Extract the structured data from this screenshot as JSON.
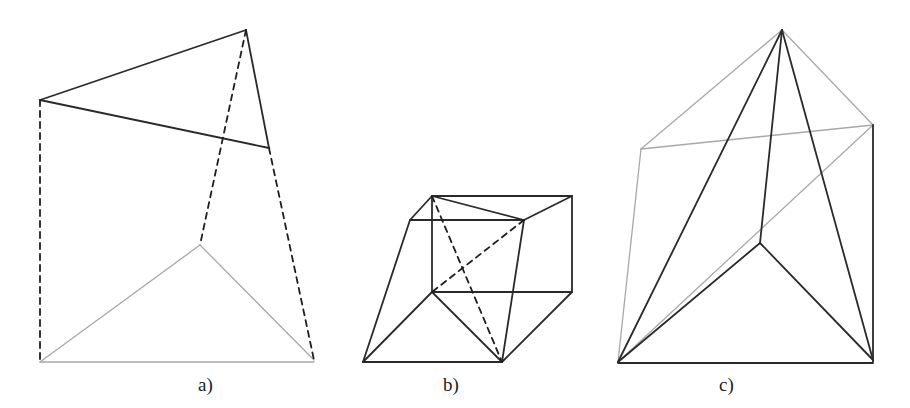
{
  "figure": {
    "panels": [
      {
        "label": "a)",
        "edges": {
          "dark": [
            [
              [
                40,
                100
              ],
              [
                246,
                30
              ]
            ],
            [
              [
                40,
                100
              ],
              [
                269,
                148
              ]
            ],
            [
              [
                246,
                30
              ],
              [
                269,
                148
              ]
            ]
          ],
          "dashed": [
            [
              [
                40,
                100
              ],
              [
                40,
                362
              ]
            ],
            [
              [
                246,
                30
              ],
              [
                200,
                245
              ]
            ],
            [
              [
                269,
                148
              ],
              [
                314,
                360
              ]
            ]
          ],
          "light": [
            [
              [
                40,
                362
              ],
              [
                200,
                245
              ]
            ],
            [
              [
                200,
                245
              ],
              [
                314,
                360
              ]
            ],
            [
              [
                40,
                362
              ],
              [
                314,
                362
              ]
            ]
          ]
        }
      },
      {
        "label": "b)",
        "edges": {
          "dark": [
            [
              [
                432,
                196
              ],
              [
                572,
                196
              ]
            ],
            [
              [
                432,
                196
              ],
              [
                410,
                220
              ]
            ],
            [
              [
                410,
                220
              ],
              [
                524,
                220
              ]
            ],
            [
              [
                432,
                196
              ],
              [
                524,
                220
              ]
            ],
            [
              [
                572,
                196
              ],
              [
                524,
                220
              ]
            ],
            [
              [
                572,
                196
              ],
              [
                572,
                292
              ]
            ],
            [
              [
                432,
                196
              ],
              [
                432,
                292
              ]
            ],
            [
              [
                432,
                292
              ],
              [
                572,
                292
              ]
            ],
            [
              [
                410,
                220
              ],
              [
                363,
                362
              ]
            ],
            [
              [
                363,
                362
              ],
              [
                502,
                362
              ]
            ],
            [
              [
                432,
                292
              ],
              [
                363,
                362
              ]
            ],
            [
              [
                432,
                292
              ],
              [
                502,
                362
              ]
            ],
            [
              [
                524,
                220
              ],
              [
                502,
                362
              ]
            ],
            [
              [
                572,
                292
              ],
              [
                502,
                362
              ]
            ]
          ],
          "dashed": [
            [
              [
                432,
                196
              ],
              [
                502,
                362
              ]
            ],
            [
              [
                524,
                220
              ],
              [
                432,
                292
              ]
            ]
          ],
          "light": []
        }
      },
      {
        "label": "c)",
        "edges": {
          "dark": [
            [
              [
                782,
                30
              ],
              [
                618,
                362
              ]
            ],
            [
              [
                782,
                30
              ],
              [
                760,
                243
              ]
            ],
            [
              [
                782,
                30
              ],
              [
                873,
                360
              ]
            ],
            [
              [
                760,
                243
              ],
              [
                618,
                362
              ]
            ],
            [
              [
                760,
                243
              ],
              [
                873,
                360
              ]
            ],
            [
              [
                618,
                363
              ],
              [
                873,
                363
              ]
            ],
            [
              [
                873,
                125
              ],
              [
                873,
                362
              ]
            ]
          ],
          "dashed": [],
          "light": [
            [
              [
                782,
                30
              ],
              [
                641,
                149
              ]
            ],
            [
              [
                782,
                30
              ],
              [
                873,
                125
              ]
            ],
            [
              [
                641,
                149
              ],
              [
                873,
                125
              ]
            ],
            [
              [
                641,
                149
              ],
              [
                618,
                362
              ]
            ],
            [
              [
                873,
                125
              ],
              [
                618,
                362
              ]
            ]
          ]
        }
      }
    ],
    "colors": {
      "dark": "#2a2a2a",
      "dashed": "#1e1e1e",
      "light": "#a8a8a8"
    }
  }
}
